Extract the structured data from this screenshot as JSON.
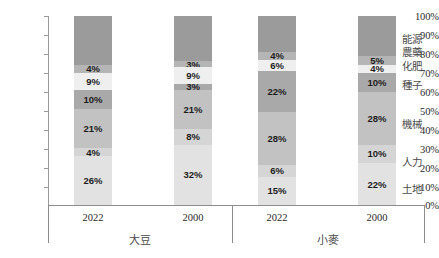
{
  "chart_data": {
    "type": "bar",
    "subtype": "stacked-100-percent",
    "title": "",
    "xlabel": "",
    "ylabel": "",
    "ylim": [
      0,
      100
    ],
    "grid": false,
    "legend_position": "right",
    "y_ticks": [
      "0%",
      "10%",
      "20%",
      "30%",
      "40%",
      "50%",
      "60%",
      "70%",
      "80%",
      "90%",
      "100%"
    ],
    "categories": [
      "2022",
      "2000",
      "2022",
      "2000"
    ],
    "groups": [
      {
        "label": "大豆",
        "categories": [
          "2022",
          "2000"
        ]
      },
      {
        "label": "小麥",
        "categories": [
          "2022",
          "2000"
        ]
      }
    ],
    "series": [
      {
        "name": "土地",
        "values": [
          26,
          32,
          15,
          22
        ],
        "labels": [
          "26%",
          "32%",
          "15%",
          "22%"
        ],
        "color": "#e2e2e2"
      },
      {
        "name": "人力",
        "values": [
          4,
          8,
          6,
          10
        ],
        "labels": [
          "4%",
          "8%",
          "6%",
          "10%"
        ],
        "color": "#d5d5d5"
      },
      {
        "name": "機械",
        "values": [
          21,
          21,
          28,
          28
        ],
        "labels": [
          "21%",
          "21%",
          "28%",
          "28%"
        ],
        "color": "#c2c2c2"
      },
      {
        "name": "種子",
        "values": [
          10,
          3,
          22,
          10
        ],
        "labels": [
          "10%",
          "3%",
          "22%",
          "10%"
        ],
        "color": "#a9a9a9"
      },
      {
        "name": "化肥",
        "values": [
          9,
          9,
          6,
          4
        ],
        "labels": [
          "9%",
          "9%",
          "6%",
          "4%"
        ],
        "color": "#efefef"
      },
      {
        "name": "農藥",
        "values": [
          4,
          3,
          4,
          5
        ],
        "labels": [
          "4%",
          "3%",
          "4%",
          "5%"
        ],
        "color": "#b5b5b5"
      },
      {
        "name": "能源",
        "values": [
          26,
          24,
          19,
          21
        ],
        "labels": [
          "",
          "",
          "",
          ""
        ],
        "color": "#9b9b9b"
      }
    ],
    "legend_entries": [
      "能源",
      "農藥",
      "化肥",
      "種子",
      "機械",
      "人力",
      "土地"
    ]
  }
}
